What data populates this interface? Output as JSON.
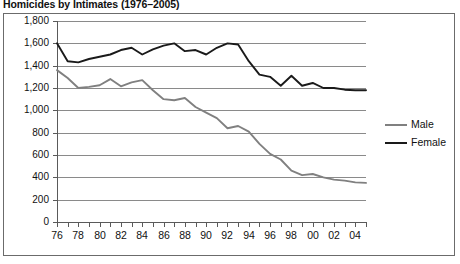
{
  "chart_data": {
    "type": "line",
    "title": "Homicides by Intimates (1976–2005)",
    "xlabel": "",
    "ylabel": "",
    "ylim": [
      0,
      1800
    ],
    "ytick_step": 200,
    "ytick_labels": [
      "1,800",
      "1,600",
      "1,400",
      "1,200",
      "1,000",
      "800",
      "600",
      "400",
      "200",
      "0"
    ],
    "ytick_values": [
      1800,
      1600,
      1400,
      1200,
      1000,
      800,
      600,
      400,
      200,
      0
    ],
    "grid": true,
    "legend_position": "right",
    "x": [
      1976,
      1977,
      1978,
      1979,
      1980,
      1981,
      1982,
      1983,
      1984,
      1985,
      1986,
      1987,
      1988,
      1989,
      1990,
      1991,
      1992,
      1993,
      1994,
      1995,
      1996,
      1997,
      1998,
      1999,
      2000,
      2001,
      2002,
      2003,
      2004,
      2005
    ],
    "xtick_labels": [
      "76",
      "77",
      "78",
      "79",
      "80",
      "81",
      "82",
      "83",
      "84",
      "85",
      "86",
      "87",
      "88",
      "89",
      "90",
      "91",
      "92",
      "93",
      "94",
      "95",
      "96",
      "97",
      "98",
      "99",
      "00",
      "01",
      "02",
      "03",
      "04",
      "05"
    ],
    "xtick_labels_shown": [
      "76",
      "78",
      "80",
      "82",
      "84",
      "86",
      "88",
      "90",
      "92",
      "94",
      "96",
      "98",
      "00",
      "02",
      "04"
    ],
    "series": [
      {
        "name": "Male",
        "color": "#808080",
        "values": [
          1360,
          1290,
          1200,
          1210,
          1225,
          1280,
          1215,
          1250,
          1270,
          1180,
          1100,
          1090,
          1110,
          1030,
          980,
          930,
          840,
          860,
          810,
          700,
          610,
          560,
          460,
          420,
          430,
          400,
          380,
          370,
          355,
          350
        ]
      },
      {
        "name": "Female",
        "color": "#1a1a1a",
        "values": [
          1600,
          1440,
          1430,
          1460,
          1480,
          1500,
          1540,
          1560,
          1500,
          1545,
          1580,
          1600,
          1530,
          1540,
          1500,
          1560,
          1600,
          1590,
          1440,
          1320,
          1300,
          1220,
          1310,
          1220,
          1245,
          1200,
          1200,
          1185,
          1180,
          1180
        ]
      }
    ]
  },
  "legend": {
    "items": [
      {
        "label": "Male"
      },
      {
        "label": "Female"
      }
    ]
  }
}
